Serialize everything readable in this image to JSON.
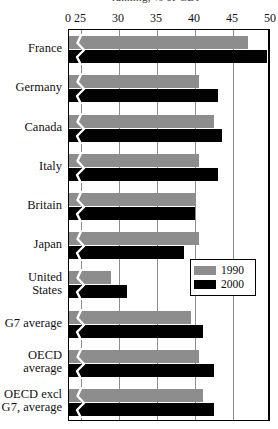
{
  "figure": {
    "cropped_title": "ranking, % of GDP",
    "background_color": "#ffffff",
    "frame_color": "#000000",
    "gridline_color": "#8c8c8c"
  },
  "legend": {
    "position": "inside-right-middle",
    "entries": [
      {
        "label": "1990",
        "color": "#8d8d8d",
        "swatch_name": "legend-swatch-1990"
      },
      {
        "label": "2000",
        "color": "#000000",
        "swatch_name": "legend-swatch-2000"
      }
    ]
  },
  "chart_data": {
    "type": "bar",
    "orientation": "horizontal",
    "title": "",
    "xlabel": "",
    "ylabel": "",
    "grid": true,
    "axis_break": true,
    "axis_break_between": [
      0,
      25
    ],
    "xlim": [
      0,
      50
    ],
    "tick_labels": [
      "0",
      "25",
      "30",
      "35",
      "40",
      "45",
      "50"
    ],
    "tick_values": [
      0,
      25,
      30,
      35,
      40,
      45,
      50
    ],
    "categories": [
      "France",
      "Germany",
      "Canada",
      "Italy",
      "Britain",
      "Japan",
      "United\nStates",
      "G7 average",
      "OECD\naverage",
      "OECD excl\nG7, average"
    ],
    "series": [
      {
        "name": "1990",
        "color": "#8d8d8d",
        "values": [
          47.0,
          40.5,
          42.5,
          40.5,
          40.0,
          40.5,
          29.0,
          39.5,
          40.5,
          41.0
        ]
      },
      {
        "name": "2000",
        "color": "#000000",
        "values": [
          49.5,
          43.0,
          43.5,
          43.0,
          40.0,
          38.5,
          31.0,
          41.0,
          42.5,
          42.5
        ]
      }
    ]
  }
}
